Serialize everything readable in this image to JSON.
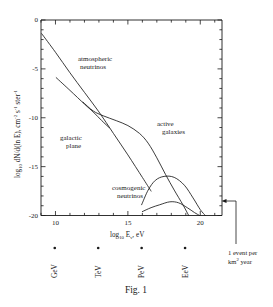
{
  "figure": {
    "caption": "Fig. 1"
  },
  "chart_data": {
    "type": "line",
    "title": "",
    "xlabel": "log10 Eν, eV",
    "ylabel": "log10 dN/d(ln E), cm-2 s-1 ster-1",
    "xlabel_parts": {
      "main": "log",
      "sub1": "10",
      "mid": " E",
      "sub2": "ν",
      "tail": ", eV"
    },
    "ylabel_parts": {
      "main": "log",
      "sub1": "10",
      "mid": " dN/d(ln E), cm",
      "sup1": "-2",
      "mid2": " s",
      "sup2": "-1",
      "mid3": " ster",
      "sup3": "-1"
    },
    "xlim": [
      9,
      21.5
    ],
    "ylim": [
      -20,
      0
    ],
    "grid": false,
    "legend": "inline-annotations",
    "xticks": [
      9,
      10,
      11,
      12,
      13,
      14,
      15,
      16,
      17,
      18,
      19,
      20,
      21
    ],
    "xtick_labels": [
      {
        "value": 10,
        "label": "10"
      },
      {
        "value": 15,
        "label": "15"
      },
      {
        "value": 20,
        "label": "20"
      }
    ],
    "yticks": [
      0,
      -1,
      -2,
      -3,
      -4,
      -5,
      -6,
      -7,
      -8,
      -9,
      -10,
      -11,
      -12,
      -13,
      -14,
      -15,
      -16,
      -17,
      -18,
      -19,
      -20
    ],
    "ytick_labels": [
      {
        "value": 0,
        "label": "0"
      },
      {
        "value": -5,
        "label": "-5"
      },
      {
        "value": -10,
        "label": "-10"
      },
      {
        "value": -15,
        "label": "-15"
      },
      {
        "value": -20,
        "label": "-20"
      }
    ],
    "series": [
      {
        "name": "atmospheric neutrinos",
        "label": "atmospheric\nneutrinos",
        "label_line1": "atmospheric",
        "label_line2": "neutrinos",
        "points": [
          [
            9.05,
            -1.4
          ],
          [
            10.0,
            -3.3
          ],
          [
            11.0,
            -5.4
          ],
          [
            12.0,
            -7.4
          ],
          [
            13.0,
            -9.4
          ],
          [
            14.0,
            -11.6
          ],
          [
            15.0,
            -13.8
          ],
          [
            16.0,
            -16.1
          ],
          [
            16.6,
            -17.5
          ]
        ]
      },
      {
        "name": "galactic plane",
        "label": "galactic\nplane",
        "label_line1": "galactic",
        "label_line2": "plane",
        "points": [
          [
            10.05,
            -5.9
          ],
          [
            11.0,
            -7.2
          ],
          [
            12.0,
            -8.6
          ],
          [
            12.6,
            -9.4
          ],
          [
            13.2,
            -10.3
          ],
          [
            13.7,
            -11.0
          ]
        ]
      },
      {
        "name": "active galaxies",
        "label": "active\ngalaxies",
        "label_line1": "active",
        "label_line2": "galaxies",
        "points": [
          [
            11.9,
            -8.4
          ],
          [
            12.6,
            -9.3
          ],
          [
            13.3,
            -9.8
          ],
          [
            14.2,
            -10.3
          ],
          [
            15.0,
            -10.8
          ],
          [
            15.8,
            -11.6
          ],
          [
            16.4,
            -12.6
          ],
          [
            17.0,
            -14.1
          ],
          [
            17.6,
            -15.8
          ],
          [
            18.2,
            -17.4
          ],
          [
            18.8,
            -18.9
          ],
          [
            19.2,
            -20.0
          ]
        ]
      },
      {
        "name": "cosmogenic neutrinos upper",
        "label": "cosmogenic\nneutrinos",
        "label_line1": "cosmogenic",
        "label_line2": "neutrinos",
        "points": [
          [
            15.95,
            -18.9
          ],
          [
            16.4,
            -17.4
          ],
          [
            16.9,
            -16.4
          ],
          [
            17.5,
            -16.0
          ],
          [
            18.2,
            -16.1
          ],
          [
            18.9,
            -16.9
          ],
          [
            19.5,
            -18.2
          ],
          [
            20.0,
            -19.4
          ],
          [
            20.35,
            -20.0
          ]
        ]
      },
      {
        "name": "cosmogenic neutrinos lower",
        "points": [
          [
            16.0,
            -19.6
          ],
          [
            16.6,
            -19.2
          ],
          [
            17.2,
            -18.9
          ],
          [
            17.9,
            -18.6
          ],
          [
            18.5,
            -18.7
          ],
          [
            19.1,
            -19.2
          ],
          [
            19.6,
            -19.7
          ],
          [
            19.95,
            -20.0
          ]
        ]
      }
    ],
    "energy_scale_markers": [
      {
        "label": "GeV",
        "value": 9.95
      },
      {
        "label": "TeV",
        "value": 12.95
      },
      {
        "label": "PeV",
        "value": 15.95
      },
      {
        "label": "EeV",
        "value": 18.95
      }
    ],
    "annotation": {
      "line1": "1 event per",
      "line2_main": "km",
      "line2_sup": "2",
      "line2_tail": " year",
      "arrow_y_value": -18.6
    }
  }
}
